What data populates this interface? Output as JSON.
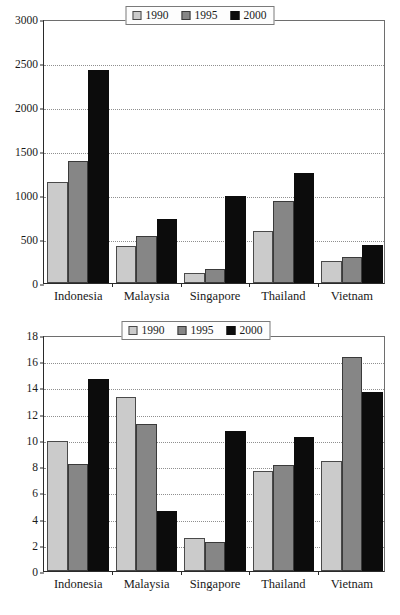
{
  "chart_data": [
    {
      "id": "top",
      "type": "bar",
      "title": "",
      "subtitle": "",
      "xlabel": "",
      "ylabel": "",
      "categories": [
        "Indonesia",
        "Malaysia",
        "Singapore",
        "Thailand",
        "Vietnam"
      ],
      "series": [
        {
          "name": "1990",
          "color": "#cbcbcb",
          "values": [
            1150,
            420,
            110,
            595,
            255
          ]
        },
        {
          "name": "1995",
          "color": "#868686",
          "values": [
            1385,
            530,
            160,
            930,
            290
          ]
        },
        {
          "name": "2000",
          "color": "#0c0c0c",
          "values": [
            2420,
            725,
            985,
            1245,
            430
          ]
        }
      ],
      "ylim": [
        0,
        3000
      ],
      "ytick_step": 500,
      "yticks": [
        "0",
        "500",
        "1000",
        "1500",
        "2000",
        "2500",
        "3000"
      ],
      "grid": true,
      "legend_position": "top-center",
      "legend_entries": [
        "1990",
        "1995",
        "2000"
      ]
    },
    {
      "id": "bottom",
      "type": "bar",
      "title": "",
      "subtitle": "",
      "xlabel": "",
      "ylabel": "",
      "categories": [
        "Indonesia",
        "Malaysia",
        "Singapore",
        "Thailand",
        "Vietnam"
      ],
      "series": [
        {
          "name": "1990",
          "color": "#cbcbcb",
          "values": [
            9.9,
            13.3,
            2.5,
            7.65,
            8.4
          ]
        },
        {
          "name": "1995",
          "color": "#868686",
          "values": [
            8.2,
            11.2,
            2.25,
            8.05,
            16.3
          ]
        },
        {
          "name": "2000",
          "color": "#0c0c0c",
          "values": [
            14.65,
            4.6,
            10.7,
            10.2,
            13.65
          ]
        }
      ],
      "ylim": [
        0,
        18
      ],
      "ytick_step": 2,
      "yticks": [
        "0",
        "2",
        "4",
        "6",
        "8",
        "10",
        "12",
        "14",
        "16",
        "18"
      ],
      "grid": true,
      "legend_position": "top-center",
      "legend_entries": [
        "1990",
        "1995",
        "2000"
      ]
    }
  ],
  "colors": {
    "series_1990": "#cbcbcb",
    "series_1995": "#868686",
    "series_2000": "#0c0c0c",
    "axis": "#2a2a2a",
    "grid": "#8f8f8f",
    "background": "#ffffff"
  }
}
